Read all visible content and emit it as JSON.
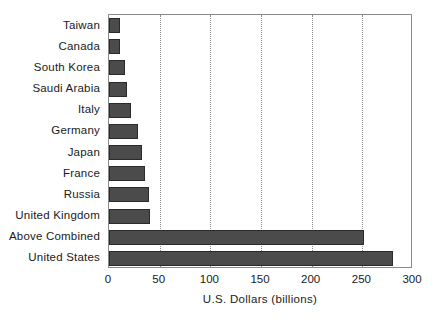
{
  "chart_data": {
    "type": "bar",
    "orientation": "horizontal",
    "title": "",
    "subtitle": "",
    "xlabel": "U.S. Dollars (billions)",
    "ylabel": "",
    "xlim": [
      0,
      300
    ],
    "xticks": [
      0,
      50,
      100,
      150,
      200,
      250,
      300
    ],
    "xtick_labels": [
      "0",
      "50",
      "100",
      "150",
      "200",
      "250",
      "300"
    ],
    "grid": "vertical-dotted",
    "legend": null,
    "bar_color": "#4b4b4b",
    "bar_edge_color": "#2a2a2a",
    "frame_color": "#8a8a8a",
    "categories": [
      "Taiwan",
      "Canada",
      "South Korea",
      "Saudi Arabia",
      "Italy",
      "Germany",
      "Japan",
      "France",
      "Russia",
      "United Kingdom",
      "Above Combined",
      "United States"
    ],
    "values": [
      11,
      11,
      16,
      18,
      22,
      29,
      33,
      36,
      39,
      40,
      252,
      280
    ]
  }
}
